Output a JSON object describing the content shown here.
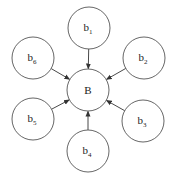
{
  "diagram": {
    "title": "",
    "center": {
      "id": "B",
      "label": "B",
      "cx": 88,
      "cy": 90,
      "r": 21
    },
    "nodes": [
      {
        "id": "b1",
        "base": "b",
        "sub": "1",
        "cx": 89,
        "cy": 28,
        "r": 21
      },
      {
        "id": "b2",
        "base": "b",
        "sub": "2",
        "cx": 144,
        "cy": 58,
        "r": 21
      },
      {
        "id": "b3",
        "base": "b",
        "sub": "3",
        "cx": 143,
        "cy": 121,
        "r": 21
      },
      {
        "id": "b4",
        "base": "b",
        "sub": "4",
        "cx": 88,
        "cy": 151,
        "r": 21
      },
      {
        "id": "b5",
        "base": "b",
        "sub": "5",
        "cx": 33,
        "cy": 119,
        "r": 21
      },
      {
        "id": "b6",
        "base": "b",
        "sub": "6",
        "cx": 33,
        "cy": 58,
        "r": 21
      }
    ],
    "edges": [
      {
        "from": "b1",
        "to": "B",
        "directed": true
      },
      {
        "from": "b2",
        "to": "B",
        "directed": true
      },
      {
        "from": "b3",
        "to": "B",
        "directed": true
      },
      {
        "from": "b4",
        "to": "B",
        "directed": true
      },
      {
        "from": "b5",
        "to": "B",
        "directed": true
      },
      {
        "from": "b6",
        "to": "B",
        "directed": true
      }
    ],
    "colors": {
      "stroke": "#555555",
      "edge": "#333333",
      "text": "#222222",
      "background": "#ffffff"
    }
  }
}
